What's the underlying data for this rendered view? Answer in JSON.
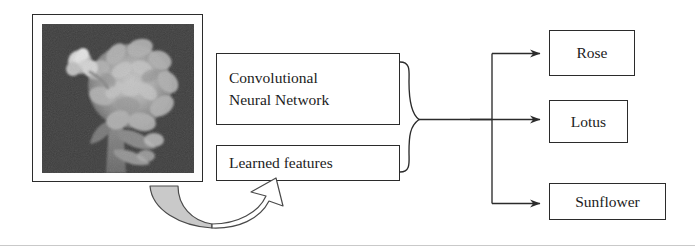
{
  "figure": {
    "type": "flow-diagram",
    "background_color": "#ffffff",
    "stroke_color": "#2b2b2b",
    "accent_fill": "#c9c9c9"
  },
  "input": {
    "photo": {
      "icon": "flower-photograph",
      "description": "Grayscale photograph of a large chrysanthemum flower with a small bud at upper left on a dark background",
      "frame_color": "#2b2b2b",
      "background_color": "#3e3e3e"
    }
  },
  "model": {
    "boxes": [
      {
        "id": "cnn",
        "line1": "Convolutional",
        "line2": "Neural Network"
      },
      {
        "id": "learned",
        "label": "Learned features"
      }
    ],
    "brace": {
      "icon": "right-curly-brace",
      "label": ""
    }
  },
  "transform_arrow": {
    "icon": "curved-block-arrow",
    "direction": "up-right",
    "fill_color": "#c9c9c9",
    "stroke_color": "#4a4a4a"
  },
  "outputs": {
    "classes": [
      {
        "id": "rose",
        "label": "Rose"
      },
      {
        "id": "lotus",
        "label": "Lotus"
      },
      {
        "id": "sunflower",
        "label": "Sunflower"
      }
    ]
  }
}
